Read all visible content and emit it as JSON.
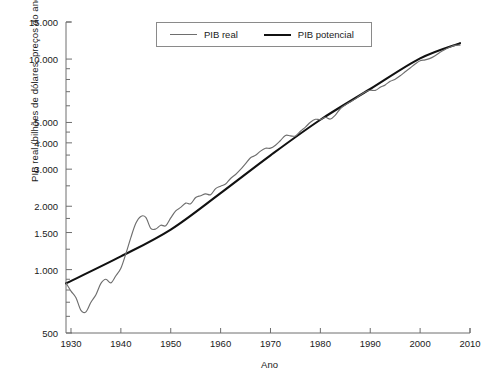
{
  "chart_data": {
    "type": "line",
    "title": "",
    "xlabel": "Ano",
    "ylabel": "PIB real (bilhões de dólares, preços do ano 2000)",
    "yscale": "log",
    "ylim": [
      500,
      15000
    ],
    "xlim": [
      1929,
      2010
    ],
    "grid": false,
    "legend_position": "top-center",
    "ytick_labels": [
      "15.000",
      "10.000",
      "5.000",
      "4.000",
      "3.000",
      "2.000",
      "1.500",
      "1.000",
      "500"
    ],
    "ytick_values": [
      15000,
      10000,
      5000,
      4000,
      3000,
      2000,
      1500,
      1000,
      500
    ],
    "yminor_values": [
      9000,
      8000,
      7000,
      6000,
      4500,
      3500,
      2500,
      1750,
      1250,
      900,
      800,
      700,
      600
    ],
    "xtick_labels": [
      "1930",
      "1940",
      "1950",
      "1960",
      "1970",
      "1980",
      "1990",
      "2000",
      "2010"
    ],
    "xtick_values": [
      1930,
      1940,
      1950,
      1960,
      1970,
      1980,
      1990,
      2000,
      2010
    ],
    "colors": {
      "pib_real": "#6e6e6e",
      "pib_potencial": "#111111",
      "axis": "#6e6e6e",
      "text": "#1a1a1a"
    },
    "series": [
      {
        "name": "PIB real",
        "color": "#6e6e6e",
        "x": [
          1929,
          1930,
          1931,
          1932,
          1933,
          1934,
          1935,
          1936,
          1937,
          1938,
          1939,
          1940,
          1941,
          1942,
          1943,
          1944,
          1945,
          1946,
          1947,
          1948,
          1949,
          1950,
          1951,
          1952,
          1953,
          1954,
          1955,
          1956,
          1957,
          1958,
          1959,
          1960,
          1961,
          1962,
          1963,
          1964,
          1965,
          1966,
          1967,
          1968,
          1969,
          1970,
          1971,
          1972,
          1973,
          1974,
          1975,
          1976,
          1977,
          1978,
          1979,
          1980,
          1981,
          1982,
          1983,
          1984,
          1985,
          1986,
          1987,
          1988,
          1989,
          1990,
          1991,
          1992,
          1993,
          1994,
          1995,
          1996,
          1997,
          1998,
          1999,
          2000,
          2001,
          2002,
          2003,
          2004,
          2005,
          2006,
          2007,
          2008
        ],
        "values": [
          865,
          790,
          735,
          640,
          630,
          700,
          760,
          860,
          900,
          865,
          935,
          1015,
          1190,
          1420,
          1660,
          1790,
          1770,
          1570,
          1560,
          1625,
          1615,
          1760,
          1900,
          1975,
          2070,
          2055,
          2200,
          2245,
          2290,
          2270,
          2425,
          2490,
          2550,
          2710,
          2830,
          2990,
          3190,
          3400,
          3490,
          3655,
          3770,
          3775,
          3900,
          4105,
          4340,
          4320,
          4310,
          4540,
          4750,
          5015,
          5175,
          5160,
          5290,
          5190,
          5420,
          5810,
          6050,
          6260,
          6470,
          6740,
          6980,
          7110,
          7100,
          7340,
          7540,
          7840,
          8030,
          8330,
          8700,
          9070,
          9470,
          9820,
          9910,
          10080,
          10380,
          10770,
          11100,
          11400,
          11620,
          11650
        ]
      },
      {
        "name": "PIB potencial",
        "color": "#111111",
        "x": [
          1929,
          1940,
          1950,
          1960,
          1970,
          1980,
          1990,
          2000,
          2008
        ],
        "values": [
          860,
          1155,
          1550,
          2310,
          3490,
          5150,
          7210,
          10080,
          11900
        ]
      }
    ]
  },
  "legend": {
    "items": [
      {
        "label": "PIB real",
        "swatch": "gray-line"
      },
      {
        "label": "PIB potencial",
        "swatch": "black-line"
      }
    ]
  },
  "axes": {
    "y_title": "PIB real (bilhões de dólares, preços do ano 2000)",
    "x_title": "Ano"
  }
}
